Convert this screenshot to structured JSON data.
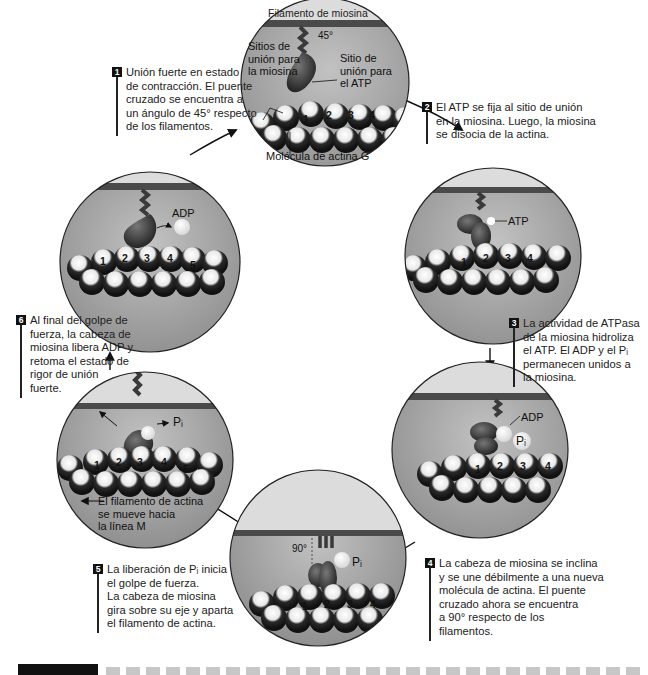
{
  "figure": {
    "title_banner": "Filamento de miosina",
    "caption_label": "FIGURA",
    "caption_partially_visible": true
  },
  "steps": [
    {
      "num": "1",
      "text": "Unión fuerte en estado\nde contracción. El puente\ncruzado se encuentra a\nun ángulo de 45° respecto\nde los filamentos."
    },
    {
      "num": "2",
      "text": "El ATP se fija al sitio de unión\nen la miosina. Luego, la miosina\nse disocia de la actina."
    },
    {
      "num": "3",
      "text": "La actividad de ATPasa\nde la miosina hidroliza\nel ATP. El ADP y el Pᵢ\npermanecen unidos a\nla miosina."
    },
    {
      "num": "4",
      "text": "La cabeza de miosina se inclina\ny se une débilmente a una nueva\nmolécula de actina. El puente\ncruzado ahora se encuentra\na 90° respecto de los\nfilamentos."
    },
    {
      "num": "5",
      "text": "La liberación de Pᵢ inicia\nel golpe de fuerza.\nLa cabeza de miosina\ngira sobre su eje y aparta\nel filamento de actina."
    },
    {
      "num": "6",
      "text": "Al final del golpe de\nfuerza, la cabeza de\nmiosina libera ADP y\nretoma el estado de\nrigor de unión\nfuerte."
    }
  ],
  "panels": {
    "p1": {
      "angle": "45°",
      "myosin_sites": "Sitios de\nunión para\nla miosina",
      "atp_site": "Sitio de\nunión para\nel ATP",
      "actin_g": "Molécula de actina G",
      "actin_numbers": [
        "1",
        "2",
        "3",
        "4"
      ]
    },
    "p2": {
      "atp": "ATP",
      "actin_numbers": [
        "1",
        "2",
        "3",
        "4"
      ]
    },
    "p3": {
      "adp": "ADP",
      "pi": "Pᵢ",
      "actin_numbers": [
        "1",
        "2",
        "3",
        "4"
      ]
    },
    "p4": {
      "angle": "90°",
      "pi": "Pᵢ",
      "actin_numbers": [
        "1",
        "2",
        "3",
        "4"
      ]
    },
    "p5": {
      "pi": "Pᵢ",
      "movement": "El filamento de actina\nse mueve hacia\nla línea M",
      "actin_numbers": [
        "1",
        "2",
        "3",
        "4",
        "5"
      ]
    },
    "p6": {
      "adp": "ADP",
      "actin_numbers": [
        "1",
        "2",
        "3",
        "4",
        "5"
      ]
    }
  },
  "colors": {
    "panel_bg": "#a8a8a8",
    "filament_band": "#d9d9d9",
    "thick_filament": "#4a4a4a",
    "myosin_head": "#3a3a3a",
    "actin_dark": "#222222",
    "actin_light": "#f2f2f2",
    "text": "#1a1a1a"
  }
}
